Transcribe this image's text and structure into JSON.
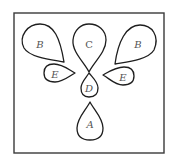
{
  "diagram": {
    "type": "orbital-lobes",
    "frame": {
      "x": 14,
      "y": 13,
      "width": 150,
      "height": 140
    },
    "lobes": [
      {
        "id": "B-left",
        "label": "B",
        "italic": true
      },
      {
        "id": "C",
        "label": "C",
        "italic": false
      },
      {
        "id": "B-right",
        "label": "B",
        "italic": true
      },
      {
        "id": "E-left",
        "label": "E",
        "italic": true
      },
      {
        "id": "E-right",
        "label": "E",
        "italic": true
      },
      {
        "id": "D",
        "label": "D",
        "italic": true
      },
      {
        "id": "A",
        "label": "A",
        "italic": true
      }
    ],
    "colors": {
      "stroke": "#1e1e1e",
      "frame": "#3a3a3a",
      "label": "#555555",
      "background": "#ffffff"
    }
  }
}
